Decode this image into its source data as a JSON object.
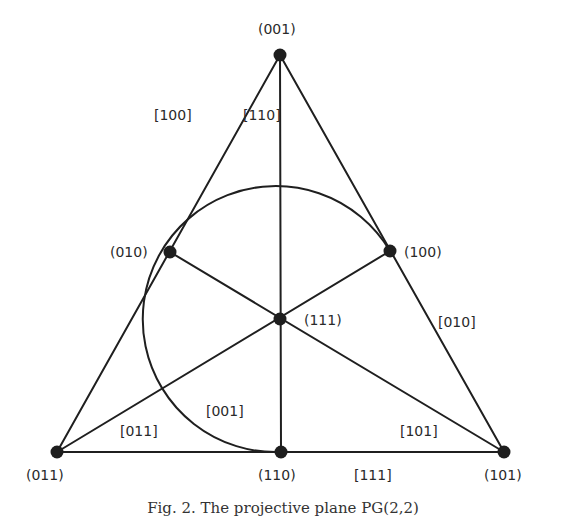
{
  "figure": {
    "caption": "Fig. 2. The projective plane PG(2,2)",
    "colors": {
      "ink": "#1f1f1f",
      "background": "#ffffff"
    },
    "points": [
      {
        "id": "p001",
        "label": "(001)",
        "x": 280,
        "y": 55
      },
      {
        "id": "p010",
        "label": "(010)",
        "x": 170,
        "y": 252
      },
      {
        "id": "p100",
        "label": "(100)",
        "x": 390,
        "y": 251
      },
      {
        "id": "p111",
        "label": "(111)",
        "x": 280,
        "y": 319
      },
      {
        "id": "p011",
        "label": "(011)",
        "x": 57,
        "y": 452
      },
      {
        "id": "p110",
        "label": "(110)",
        "x": 281,
        "y": 452
      },
      {
        "id": "p101",
        "label": "(101)",
        "x": 504,
        "y": 452
      }
    ],
    "lines": [
      {
        "id": "l100",
        "label": "[100]",
        "through": [
          "(001)",
          "(010)",
          "(011)"
        ]
      },
      {
        "id": "l110",
        "label": "[110]",
        "through": [
          "(001)",
          "(111)",
          "(110)"
        ]
      },
      {
        "id": "l010",
        "label": "[010]",
        "through": [
          "(001)",
          "(100)",
          "(101)"
        ]
      },
      {
        "id": "l011",
        "label": "[011]",
        "through": [
          "(011)",
          "(111)",
          "(100)"
        ]
      },
      {
        "id": "l101",
        "label": "[101]",
        "through": [
          "(010)",
          "(111)",
          "(101)"
        ]
      },
      {
        "id": "l111",
        "label": "[111]",
        "through": [
          "(011)",
          "(110)",
          "(101)"
        ]
      },
      {
        "id": "l001",
        "label": "[001]",
        "through": [
          "(010)",
          "(100)",
          "(110)"
        ],
        "shape": "circle-arc"
      }
    ]
  }
}
